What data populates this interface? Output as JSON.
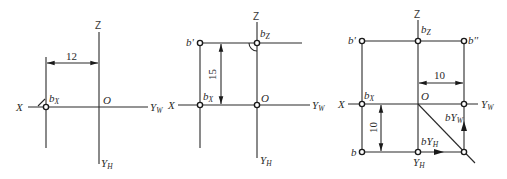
{
  "figure": {
    "panels": [
      {
        "id": "panel-1",
        "axes": {
          "x": "X",
          "z": "Z",
          "origin": "O",
          "yw_main": "Y",
          "yw_sub": "W",
          "yh_main": "Y",
          "yh_sub": "H"
        },
        "points": [
          {
            "main": "b",
            "sub": "X"
          }
        ],
        "dimensions": [
          {
            "value": "12",
            "orientation": "horizontal"
          }
        ]
      },
      {
        "id": "panel-2",
        "axes": {
          "x": "X",
          "z": "Z",
          "origin": "O",
          "yw_main": "Y",
          "yw_sub": "W",
          "yh_main": "Y",
          "yh_sub": "H"
        },
        "points": [
          {
            "main": "b'",
            "sub": ""
          },
          {
            "main": "b",
            "sub": "Z"
          },
          {
            "main": "b",
            "sub": "X"
          }
        ],
        "dimensions": [
          {
            "value": "15",
            "orientation": "vertical"
          }
        ]
      },
      {
        "id": "panel-3",
        "axes": {
          "x": "X",
          "z": "Z",
          "origin": "O",
          "yw_main": "Y",
          "yw_sub": "W",
          "yh_main": "Y",
          "yh_sub": "H"
        },
        "points": [
          {
            "main": "b'",
            "sub": ""
          },
          {
            "main": "b",
            "sub": "Z"
          },
          {
            "main": "b''",
            "sub": ""
          },
          {
            "main": "b",
            "sub": "X"
          },
          {
            "main": "b",
            "sub": ""
          },
          {
            "main": "bY",
            "sub": "W"
          },
          {
            "main": "bY",
            "sub": "H"
          }
        ],
        "dimensions": [
          {
            "value": "10",
            "orientation": "horizontal"
          },
          {
            "value": "10",
            "orientation": "vertical"
          }
        ]
      }
    ]
  }
}
